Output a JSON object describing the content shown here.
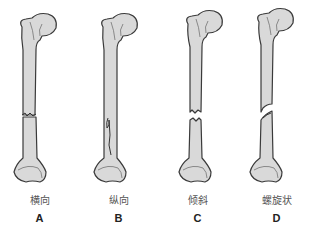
{
  "colors": {
    "bone_fill": "#d9d9d9",
    "bone_outline": "#3a3a3a",
    "background": "#ffffff"
  },
  "panels": [
    {
      "letter": "A",
      "label": "横向",
      "fracture_type": "transverse"
    },
    {
      "letter": "B",
      "label": "纵向",
      "fracture_type": "longitudinal"
    },
    {
      "letter": "C",
      "label": "倾斜",
      "fracture_type": "oblique"
    },
    {
      "letter": "D",
      "label": "螺旋状",
      "fracture_type": "spiral"
    }
  ]
}
